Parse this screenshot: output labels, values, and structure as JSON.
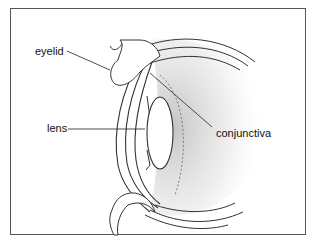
{
  "diagram": {
    "type": "anatomical cross-section",
    "subject": "eye",
    "labels": [
      {
        "id": "eyelid",
        "text": "eyelid"
      },
      {
        "id": "lens",
        "text": "lens"
      },
      {
        "id": "conjunctiva",
        "text": "conjunctiva"
      }
    ],
    "colors": {
      "line": "#333333",
      "shade": "#c8c8c8",
      "frame": "#555555",
      "background": "#ffffff"
    }
  }
}
